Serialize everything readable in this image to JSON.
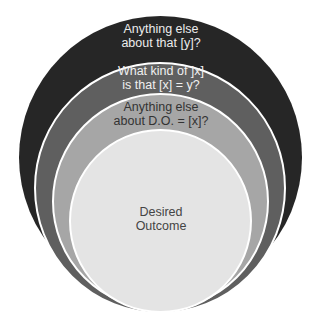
{
  "diagram": {
    "type": "nested-circles",
    "layers": [
      {
        "id": "outer",
        "label_lines": [
          "Anything else",
          "about that [y]?"
        ],
        "fill": "#262626",
        "text_color": "#ececec"
      },
      {
        "id": "second",
        "label_lines": [
          "What kind of ]x]",
          "is that [x] = y?"
        ],
        "fill": "#5f5f5f",
        "text_color": "#f0f0f0"
      },
      {
        "id": "third",
        "label_lines": [
          "Anything else",
          "about D.O. = [x]?"
        ],
        "fill": "#a6a6a6",
        "text_color": "#333333"
      },
      {
        "id": "core",
        "label_lines": [
          "Desired",
          "Outcome"
        ],
        "fill": "#e4e4e4",
        "text_color": "#444444"
      }
    ]
  }
}
